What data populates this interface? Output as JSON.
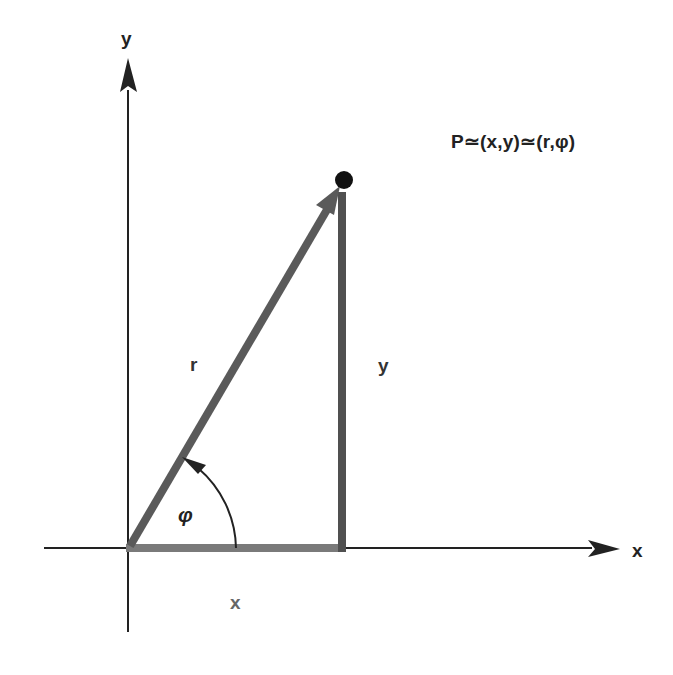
{
  "labels": {
    "y_axis": "y",
    "x_axis": "x",
    "point": "P≃(x,y)≃(r,φ)",
    "r": "r",
    "y_segment": "y",
    "x_segment": "x",
    "angle": "φ"
  },
  "colors": {
    "background": "#ffffff",
    "axis": "#222222",
    "r_vector": "#5a5a5a",
    "y_segment": "#505050",
    "x_segment": "#7a7a7a",
    "point": "#111111",
    "x_segment_label": "#666666"
  },
  "geometry": {
    "origin": [
      128,
      548
    ],
    "point": [
      344,
      181
    ]
  }
}
